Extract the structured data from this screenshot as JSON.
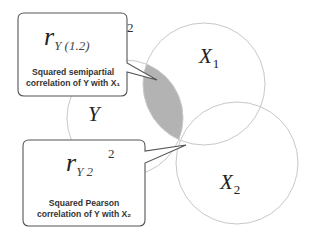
{
  "diagram": {
    "type": "venn",
    "circles": [
      {
        "id": "Y",
        "label": "Y",
        "subscript": ""
      },
      {
        "id": "X1",
        "label": "X",
        "subscript": "1"
      },
      {
        "id": "X2",
        "label": "X",
        "subscript": "2"
      }
    ],
    "shaded_region": "Y ∩ X1 excluding X2",
    "colors": {
      "circle_stroke": "#c8c8c8",
      "shade": "#b3b3b3",
      "callout_border": "#555555",
      "text": "#333333"
    },
    "callouts": [
      {
        "formula_r": "r",
        "formula_sub": "Y (1.2)",
        "formula_sup": "2",
        "line1": "Squared  semipartial",
        "line2": "correlation of Y with X₁"
      },
      {
        "formula_r": "r",
        "formula_sub": "Y 2",
        "formula_sup": "2",
        "line1": "Squared Pearson",
        "line2": "correlation of Y with X₂"
      }
    ]
  }
}
